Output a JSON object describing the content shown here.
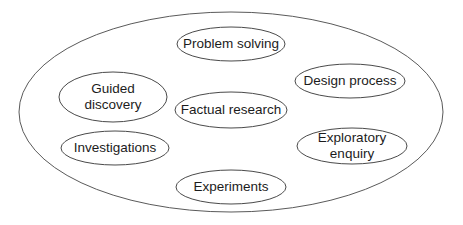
{
  "diagram": {
    "outer": {
      "cx": 231,
      "cy": 112,
      "rx": 212,
      "ry": 100
    },
    "nodes": [
      {
        "id": "problem-solving",
        "label": "Problem solving",
        "cx": 231,
        "cy": 44,
        "rx": 54,
        "ry": 17
      },
      {
        "id": "guided-discovery",
        "label": "Guided\ndiscovery",
        "cx": 113,
        "cy": 97,
        "rx": 54,
        "ry": 25
      },
      {
        "id": "design-process",
        "label": "Design process",
        "cx": 350,
        "cy": 81,
        "rx": 55,
        "ry": 17
      },
      {
        "id": "factual-research",
        "label": "Factual research",
        "cx": 231,
        "cy": 110,
        "rx": 56,
        "ry": 18
      },
      {
        "id": "investigations",
        "label": "Investigations",
        "cx": 115,
        "cy": 148,
        "rx": 54,
        "ry": 17
      },
      {
        "id": "exploratory-enquiry",
        "label": "Exploratory\nenquiry",
        "cx": 352,
        "cy": 146,
        "rx": 55,
        "ry": 18
      },
      {
        "id": "experiments",
        "label": "Experiments",
        "cx": 231,
        "cy": 187,
        "rx": 55,
        "ry": 17
      }
    ]
  }
}
